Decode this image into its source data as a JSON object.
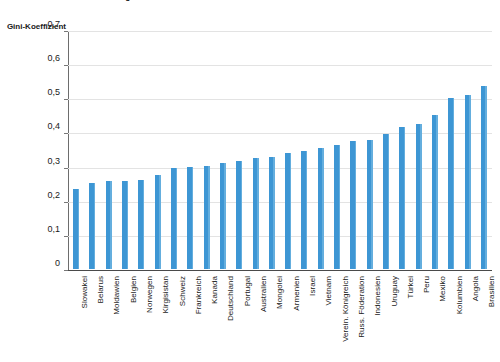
{
  "chart_data": {
    "type": "bar",
    "title": "Indikator 10.1 Einkommensungleichheit weltweit",
    "ylabel": "Gini-Koeffizient",
    "xlabel": "",
    "ylim": [
      0,
      0.7
    ],
    "ytick_labels": [
      "0",
      "0,1",
      "0,2",
      "0,3",
      "0,4",
      "0,5",
      "0,6",
      "0,7"
    ],
    "ytick_values": [
      0,
      0.1,
      0.2,
      0.3,
      0.4,
      0.5,
      0.6,
      0.7
    ],
    "grid": true,
    "legend": false,
    "bar_color": "#3d96d4",
    "categories": [
      "Slowakei",
      "Belarus",
      "Moldawien",
      "Belgien",
      "Norwegen",
      "Kirgisistan",
      "Schweiz",
      "Frankreich",
      "Kanada",
      "Deutschland",
      "Portugal",
      "Australien",
      "Mongolei",
      "Armenien",
      "Israel",
      "Vietnam",
      "Verein. Königreich",
      "Russ. Föderation",
      "Indonesien",
      "Uruguay",
      "Türkei",
      "Peru",
      "Mexiko",
      "Kolumbien",
      "Angola",
      "Brasilien"
    ],
    "values": [
      0.235,
      0.252,
      0.257,
      0.258,
      0.261,
      0.275,
      0.295,
      0.299,
      0.303,
      0.311,
      0.316,
      0.324,
      0.327,
      0.341,
      0.346,
      0.355,
      0.364,
      0.374,
      0.377,
      0.396,
      0.417,
      0.425,
      0.452,
      0.502,
      0.511,
      0.536
    ]
  }
}
